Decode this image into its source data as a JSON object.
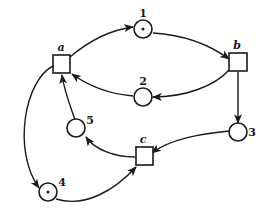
{
  "diagram": {
    "type": "petri-net",
    "colors": {
      "stroke": "#1a1a1a",
      "background": "#ffffff"
    },
    "places": [
      {
        "id": "1",
        "label": "1",
        "tokens": 1
      },
      {
        "id": "2",
        "label": "2",
        "tokens": 0
      },
      {
        "id": "3",
        "label": "3",
        "tokens": 0
      },
      {
        "id": "4",
        "label": "4",
        "tokens": 1
      },
      {
        "id": "5",
        "label": "5",
        "tokens": 0
      }
    ],
    "transitions": [
      {
        "id": "a",
        "label": "a"
      },
      {
        "id": "b",
        "label": "b"
      },
      {
        "id": "c",
        "label": "c"
      }
    ],
    "arcs": [
      {
        "from": "a",
        "to": "1"
      },
      {
        "from": "1",
        "to": "b"
      },
      {
        "from": "b",
        "to": "2"
      },
      {
        "from": "2",
        "to": "a"
      },
      {
        "from": "b",
        "to": "3"
      },
      {
        "from": "3",
        "to": "c"
      },
      {
        "from": "c",
        "to": "5"
      },
      {
        "from": "5",
        "to": "a"
      },
      {
        "from": "a",
        "to": "4"
      },
      {
        "from": "4",
        "to": "c"
      }
    ]
  }
}
